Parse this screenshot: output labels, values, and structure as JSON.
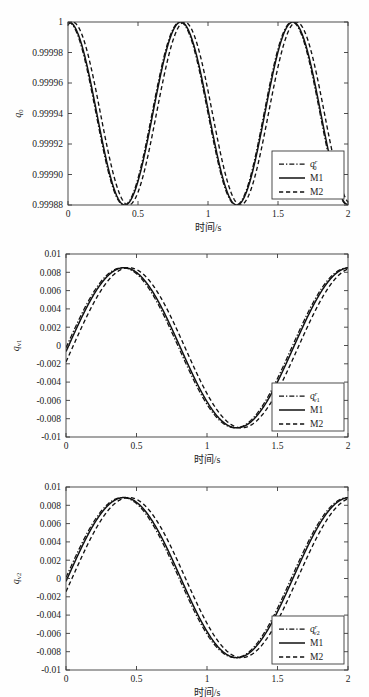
{
  "figure": {
    "background": "#fefefe",
    "ink": "#111111",
    "panel_count": 3
  },
  "chart_data": [
    {
      "type": "line",
      "title": "",
      "xlabel": "时间/s",
      "ylabel": "q0",
      "ylabel_base": "q",
      "ylabel_sub": "0",
      "xlim": [
        0,
        2
      ],
      "ylim": [
        0.99988,
        1.0
      ],
      "xticks": [
        0,
        0.5,
        1,
        1.5,
        2
      ],
      "xticklabels": [
        "0",
        "0.5",
        "1",
        "1.5",
        "2"
      ],
      "yticks": [
        0.99988,
        0.9999,
        0.99992,
        0.99994,
        0.99996,
        0.99998,
        1
      ],
      "yticklabels": [
        "0.99988",
        "0.99990",
        "0.99992",
        "0.99994",
        "0.99996",
        "0.99998",
        "1"
      ],
      "grid": false,
      "legend_position": "lower-right",
      "legend": [
        {
          "label": "q0r",
          "base": "q",
          "sub": "0",
          "sup": "r",
          "style": "dashdot"
        },
        {
          "label": "M1",
          "base": "M1",
          "sub": "",
          "sup": "",
          "style": "solid"
        },
        {
          "label": "M2",
          "base": "M2",
          "sub": "",
          "sup": "",
          "style": "dashed"
        }
      ],
      "series": [
        {
          "name": "q0r",
          "style": "dashdot",
          "model": {
            "form": "cosine_offset",
            "mean": 0.99994,
            "amplitude": 6e-05,
            "period": 0.8,
            "phase": 0.0,
            "offset_t": 0.0
          }
        },
        {
          "name": "M1",
          "style": "solid",
          "model": {
            "form": "cosine_offset",
            "mean": 0.99994,
            "amplitude": 6e-05,
            "period": 0.8,
            "phase": 0.0,
            "offset_t": 0.006
          }
        },
        {
          "name": "M2",
          "style": "dashed",
          "model": {
            "form": "cosine_offset",
            "mean": 0.99994,
            "amplitude": 6e-05,
            "period": 0.8,
            "phase": 0.0,
            "offset_t": 0.032
          }
        }
      ],
      "notes": "q0 oscillates between 1 and about 0.999884 with period 0.8 s; peaks at t=0, 0.8, 1.6; troughs near t=0.4 and 1.2."
    },
    {
      "type": "line",
      "title": "",
      "xlabel": "时间/s",
      "ylabel": "qv1",
      "ylabel_base": "q",
      "ylabel_sub": "v1",
      "xlim": [
        0,
        2
      ],
      "ylim": [
        -0.01,
        0.01
      ],
      "xticks": [
        0,
        0.5,
        1,
        1.5,
        2
      ],
      "xticklabels": [
        "0",
        "0.5",
        "1",
        "1.5",
        "2"
      ],
      "yticks": [
        -0.01,
        -0.008,
        -0.006,
        -0.004,
        -0.002,
        0,
        0.002,
        0.004,
        0.006,
        0.008,
        0.01
      ],
      "yticklabels": [
        "-0.01",
        "-0.008",
        "-0.006",
        "-0.004",
        "-0.002",
        "0",
        "0.002",
        "0.004",
        "0.006",
        "0.008",
        "0.01"
      ],
      "grid": false,
      "legend_position": "lower-right",
      "legend": [
        {
          "label": "qv1r",
          "base": "q",
          "sub": "v1",
          "sup": "r",
          "style": "dashdot"
        },
        {
          "label": "M1",
          "base": "M1",
          "sub": "",
          "sup": "",
          "style": "solid"
        },
        {
          "label": "M2",
          "base": "M2",
          "sub": "",
          "sup": "",
          "style": "dashed"
        }
      ],
      "series": [
        {
          "name": "qv1r",
          "style": "dashdot",
          "model": {
            "form": "sine",
            "mean": -0.00025,
            "amplitude": 0.00875,
            "period": 1.6,
            "phase": 0.0,
            "offset_t": 0.0
          }
        },
        {
          "name": "M1",
          "style": "solid",
          "model": {
            "form": "sine",
            "mean": -0.00025,
            "amplitude": 0.00875,
            "period": 1.6,
            "phase": 0.0,
            "offset_t": 0.012
          }
        },
        {
          "name": "M2",
          "style": "dashed",
          "model": {
            "form": "sine",
            "mean": -0.00025,
            "amplitude": 0.00875,
            "period": 1.6,
            "phase": 0.0,
            "offset_t": 0.045
          }
        }
      ],
      "notes": "qv1 starts at 0, peaks about 0.0085 near t=0.4, troughs about -0.009 near t=1.2, returns to about 0.0085 at t=2."
    },
    {
      "type": "line",
      "title": "",
      "xlabel": "时间/s",
      "ylabel": "qv2",
      "ylabel_base": "q",
      "ylabel_sub": "v2",
      "xlim": [
        0,
        2
      ],
      "ylim": [
        -0.01,
        0.01
      ],
      "xticks": [
        0,
        0.5,
        1,
        1.5,
        2
      ],
      "xticklabels": [
        "0",
        "0.5",
        "1",
        "1.5",
        "2"
      ],
      "yticks": [
        -0.01,
        -0.008,
        -0.006,
        -0.004,
        -0.002,
        0,
        0.002,
        0.004,
        0.006,
        0.008,
        0.01
      ],
      "yticklabels": [
        "-0.01",
        "-0.008",
        "-0.006",
        "-0.004",
        "-0.002",
        "0",
        "0.002",
        "0.004",
        "0.006",
        "0.008",
        "0.01"
      ],
      "grid": false,
      "legend_position": "lower-right",
      "legend": [
        {
          "label": "qv2r",
          "base": "q",
          "sub": "v2",
          "sup": "r",
          "style": "dashdot"
        },
        {
          "label": "M1",
          "base": "M1",
          "sub": "",
          "sup": "",
          "style": "solid"
        },
        {
          "label": "M2",
          "base": "M2",
          "sub": "",
          "sup": "",
          "style": "dashed"
        }
      ],
      "series": [
        {
          "name": "qv2r",
          "style": "dashdot",
          "model": {
            "form": "sine",
            "mean": 0.0001,
            "amplitude": 0.00875,
            "period": 1.6,
            "phase": 0.0,
            "offset_t": 0.0
          }
        },
        {
          "name": "M1",
          "style": "solid",
          "model": {
            "form": "sine",
            "mean": 0.0001,
            "amplitude": 0.00875,
            "period": 1.6,
            "phase": 0.0,
            "offset_t": 0.012
          }
        },
        {
          "name": "M2",
          "style": "dashed",
          "model": {
            "form": "sine",
            "mean": 0.0001,
            "amplitude": 0.00875,
            "period": 1.6,
            "phase": 0.0,
            "offset_t": 0.045
          }
        }
      ],
      "notes": "qv2 starts at 0, peaks about 0.0088 near t=0.4, troughs about -0.0086 near t=1.2, returns to about 0.0087 at t=2."
    }
  ]
}
